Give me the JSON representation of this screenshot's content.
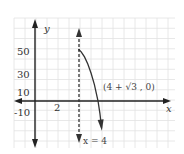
{
  "chart_data": {
    "type": "line",
    "title": "",
    "xlabel": "x",
    "ylabel": "y",
    "xlim": [
      -1.9,
      12.6
    ],
    "ylim": [
      -45,
      80
    ],
    "grid": true,
    "x_ticks": [
      {
        "value": 2,
        "label": "2"
      }
    ],
    "y_ticks": [
      {
        "value": 50,
        "label": "50"
      },
      {
        "value": 30,
        "label": "30"
      },
      {
        "value": 10,
        "label": "10"
      },
      {
        "value": -10,
        "label": "-10"
      }
    ],
    "asymptote": {
      "x": 4,
      "label": "x = 4",
      "style": "dashed"
    },
    "series": [
      {
        "name": "f(x)",
        "x": [
          4,
          4.2,
          4.5,
          4.8,
          5.1,
          5.4,
          5.73,
          5.9,
          6.05
        ],
        "y": [
          50,
          48,
          43,
          36,
          27,
          16,
          0,
          -12,
          -26
        ]
      }
    ],
    "annotations": [
      {
        "text": "(4 + √3 , 0)",
        "x": 5.73,
        "y": 0
      }
    ],
    "colors": {
      "axis": "#222222",
      "curve": "#333333",
      "grid": "#e2e2e2"
    }
  }
}
